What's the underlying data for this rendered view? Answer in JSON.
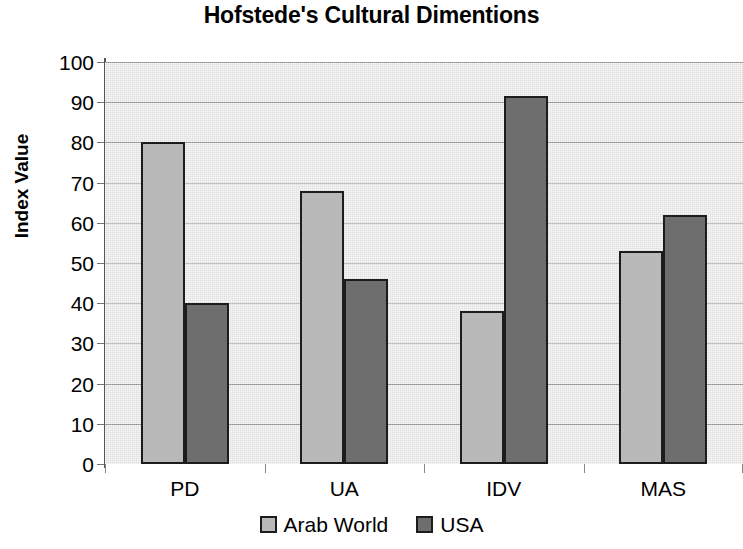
{
  "chart_data": {
    "type": "bar",
    "title": "Hofstede's Cultural Dimentions",
    "xlabel": "",
    "ylabel": "Index Value",
    "categories": [
      "PD",
      "UA",
      "IDV",
      "MAS"
    ],
    "series": [
      {
        "name": "Arab World",
        "color": "#b9b9b9",
        "values": [
          80,
          68,
          38,
          53
        ]
      },
      {
        "name": "USA",
        "color": "#6e6e6e",
        "values": [
          40,
          46,
          91.5,
          62
        ]
      }
    ],
    "ylim": [
      0,
      100
    ],
    "ytick_step": 10,
    "yticks": [
      100,
      90,
      80,
      70,
      60,
      50,
      40,
      30,
      20,
      10,
      0
    ],
    "grid": true,
    "grid_axis": "y",
    "legend_position": "bottom",
    "plot_background": "#e9e9e9",
    "bar_border_color": "#1c1c1c",
    "gridline_color": "#8f8f8f",
    "axis_color": "#555555"
  },
  "legend": {
    "items": [
      {
        "label": "Arab World"
      },
      {
        "label": "USA"
      }
    ]
  },
  "icons": {
    "legend_swatch": "filled-square-swatch"
  }
}
